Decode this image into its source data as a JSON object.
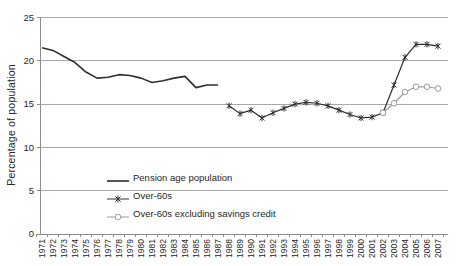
{
  "chart_data": {
    "type": "line",
    "title": "",
    "ylabel": "Percentage of population",
    "xlabel": "",
    "ylim": [
      0,
      25
    ],
    "yticks": [
      0,
      5,
      10,
      15,
      20,
      25
    ],
    "grid": "horizontal",
    "legend_position": "inside-bottom-left",
    "x_categories": [
      "1971",
      "1972",
      "1973",
      "1974",
      "1975",
      "1976",
      "1977",
      "1978",
      "1979",
      "1980",
      "1981",
      "1982",
      "1983",
      "1984",
      "1985",
      "1986",
      "1987",
      "1988",
      "1989",
      "1990",
      "1991",
      "1992",
      "1993",
      "1994",
      "1995",
      "1996",
      "1997",
      "1998",
      "1999",
      "2000",
      "2001",
      "2002",
      "2003",
      "2004",
      "2005",
      "2006",
      "2007"
    ],
    "series": [
      {
        "name": "Pension age population",
        "marker": "none",
        "color": "#2f2f2f",
        "x": [
          "1971",
          "1972",
          "1973",
          "1974",
          "1975",
          "1976",
          "1977",
          "1978",
          "1979",
          "1980",
          "1981",
          "1982",
          "1983",
          "1984",
          "1985",
          "1986",
          "1987"
        ],
        "values": [
          21.5,
          21.2,
          20.5,
          19.8,
          18.7,
          18.0,
          18.1,
          18.4,
          18.3,
          18.0,
          17.5,
          17.7,
          18.0,
          18.2,
          16.9,
          17.2,
          17.2
        ]
      },
      {
        "name": "Over-60s",
        "marker": "asterisk",
        "color": "#2f2f2f",
        "x": [
          "1988",
          "1989",
          "1990",
          "1991",
          "1992",
          "1993",
          "1994",
          "1995",
          "1996",
          "1997",
          "1998",
          "1999",
          "2000",
          "2001",
          "2002",
          "2003",
          "2004",
          "2005",
          "2006",
          "2007"
        ],
        "values": [
          14.8,
          13.9,
          14.3,
          13.4,
          14.0,
          14.5,
          15.0,
          15.2,
          15.1,
          14.8,
          14.3,
          13.8,
          13.4,
          13.5,
          14.0,
          17.2,
          20.4,
          21.9,
          21.9,
          21.7
        ]
      },
      {
        "name": "Over-60s excluding savings credit",
        "marker": "circle",
        "color": "#9c9c9c",
        "x": [
          "2002",
          "2003",
          "2004",
          "2005",
          "2006",
          "2007"
        ],
        "values": [
          14.0,
          15.1,
          16.4,
          17.0,
          17.0,
          16.8
        ]
      }
    ],
    "colors": {
      "gridline": "#a9a9a9",
      "axis": "#8c8c8c",
      "tick_text": "#262626"
    }
  }
}
